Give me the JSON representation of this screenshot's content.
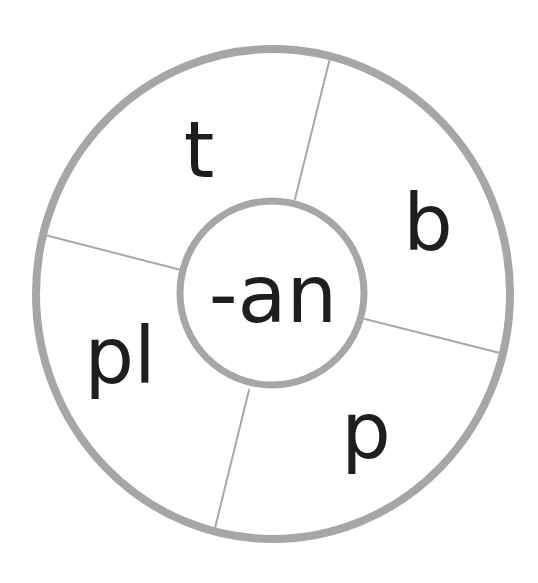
{
  "diagram": {
    "type": "word-wheel",
    "center": {
      "label": "-an",
      "text_x": 273,
      "text_y": 322
    },
    "outer_ring": {
      "cx": 273,
      "cy": 294,
      "rx": 237,
      "ry": 245,
      "stroke_width": 8
    },
    "inner_ring": {
      "cx": 272,
      "cy": 293,
      "r": 92,
      "stroke_width": 7
    },
    "colors": {
      "ring": "#a6a6a6",
      "divider": "#a8a8a8",
      "text": "#1e1e1e",
      "background": "#ffffff"
    },
    "segments": [
      {
        "label": "t",
        "text_x": 199,
        "text_y": 177
      },
      {
        "label": "b",
        "text_x": 428,
        "text_y": 250
      },
      {
        "label": "p",
        "text_x": 366,
        "text_y": 458
      },
      {
        "label": "pl",
        "text_x": 120,
        "text_y": 383
      }
    ],
    "dividers": [
      {
        "x1": 330,
        "y1": 58,
        "x2": 295,
        "y2": 199
      },
      {
        "x1": 45,
        "y1": 235,
        "x2": 181,
        "y2": 270
      },
      {
        "x1": 365,
        "y1": 319,
        "x2": 500,
        "y2": 353
      },
      {
        "x1": 249,
        "y1": 390,
        "x2": 215,
        "y2": 528
      }
    ]
  }
}
